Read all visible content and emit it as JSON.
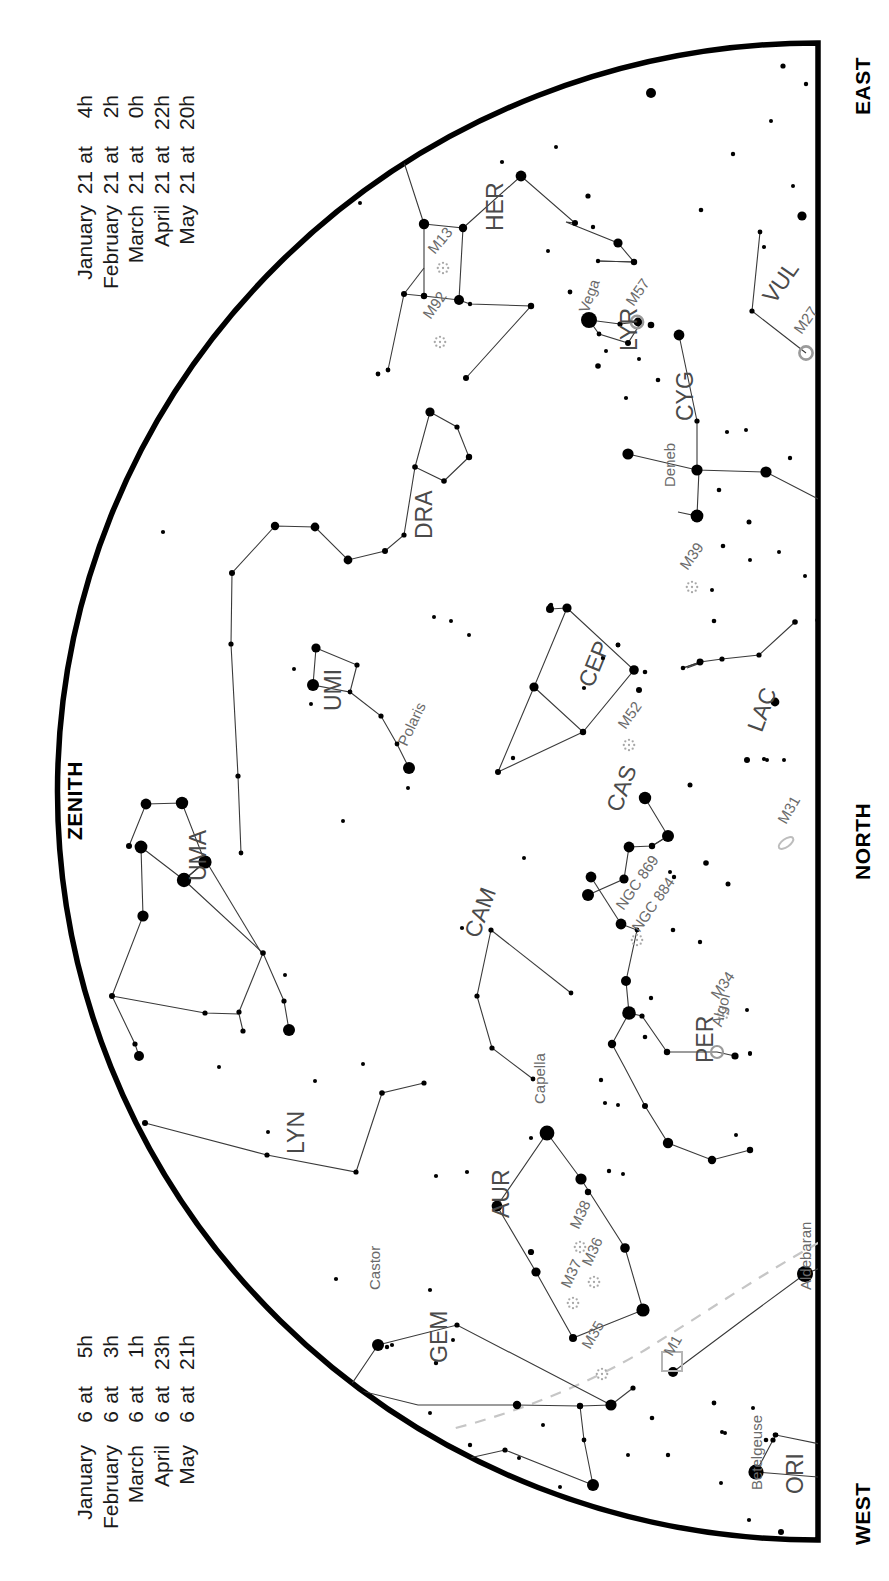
{
  "page": {
    "background_color": "#ffffff",
    "ink_color": "#000000",
    "label_color": "#3a3a3a",
    "ecliptic_color": "#b9b9b9",
    "width": 889,
    "height": 1581
  },
  "cardinals": [
    {
      "name": "east-label",
      "label": "EAST"
    },
    {
      "name": "north-label",
      "label": "NORTH"
    },
    {
      "name": "west-label",
      "label": "WEST"
    },
    {
      "name": "zenith-label",
      "label": "ZENITH"
    }
  ],
  "legend_top": {
    "name": "epoch-legend-upper",
    "rows": [
      {
        "month": "January",
        "day": "21",
        "at": "at",
        "time": "4h"
      },
      {
        "month": "February",
        "day": "21",
        "at": "at",
        "time": "2h"
      },
      {
        "month": "March",
        "day": "21",
        "at": "at",
        "time": "0h"
      },
      {
        "month": "April",
        "day": "21",
        "at": "at",
        "time": "22h"
      },
      {
        "month": "May",
        "day": "21",
        "at": "at",
        "time": "20h"
      }
    ],
    "lines": [
      "January 21 at  4h",
      "February 21 at  2h",
      "March 21 at  0h",
      "April 21 at 22h",
      "May 21 at 20h"
    ]
  },
  "legend_bottom": {
    "name": "epoch-legend-lower",
    "rows": [
      {
        "month": "January",
        "day": "6",
        "at": "at",
        "time": "5h"
      },
      {
        "month": "February",
        "day": "6",
        "at": "at",
        "time": "3h"
      },
      {
        "month": "March",
        "day": "6",
        "at": "at",
        "time": "1h"
      },
      {
        "month": "April",
        "day": "6",
        "at": "at",
        "time": "23h"
      },
      {
        "month": "May",
        "day": "6",
        "at": "at",
        "time": "21h"
      }
    ],
    "lines": [
      "January 6 at  5h",
      "February 6 at  3h",
      "March 6 at  1h",
      "April 6 at 23h",
      "May 6 at 21h"
    ]
  },
  "chart_data": {
    "type": "scatter",
    "projection": "half-disk horizon map (arc = horizon, flat edge right)",
    "legend_position": "left margin, rotated",
    "grid": false,
    "constellations": [
      {
        "abbr": "HER",
        "x": 482,
        "y": 231,
        "rot": -90
      },
      {
        "abbr": "LYR",
        "x": 616,
        "y": 351,
        "rot": -90
      },
      {
        "abbr": "CYG",
        "x": 672,
        "y": 421,
        "rot": -90
      },
      {
        "abbr": "VUL",
        "x": 757,
        "y": 293,
        "rot": -55
      },
      {
        "abbr": "DRA",
        "x": 411,
        "y": 539,
        "rot": -90
      },
      {
        "abbr": "UMI",
        "x": 320,
        "y": 711,
        "rot": -90
      },
      {
        "abbr": "CEP",
        "x": 573,
        "y": 681,
        "rot": -68
      },
      {
        "abbr": "LAC",
        "x": 742,
        "y": 726,
        "rot": -70
      },
      {
        "abbr": "CAS",
        "x": 601,
        "y": 806,
        "rot": -70
      },
      {
        "abbr": "UMA",
        "x": 185,
        "y": 881,
        "rot": -90
      },
      {
        "abbr": "CAM",
        "x": 459,
        "y": 932,
        "rot": -70
      },
      {
        "abbr": "PER",
        "x": 692,
        "y": 1063,
        "rot": -90
      },
      {
        "abbr": "LYN",
        "x": 283,
        "y": 1154,
        "rot": -90
      },
      {
        "abbr": "AUR",
        "x": 488,
        "y": 1218,
        "rot": -90
      },
      {
        "abbr": "GEM",
        "x": 426,
        "y": 1363,
        "rot": -90
      },
      {
        "abbr": "ORI",
        "x": 782,
        "y": 1494,
        "rot": -90
      }
    ],
    "named_stars": [
      {
        "name": "Vega",
        "x": 589,
        "y": 320,
        "mag": 0.0,
        "lx": 575,
        "ly": 309,
        "rot": -70
      },
      {
        "name": "Deneb",
        "x": 677,
        "y": 512,
        "mag": 1.25,
        "lx": 661,
        "ly": 487,
        "rot": -90
      },
      {
        "name": "Polaris",
        "x": 409,
        "y": 768,
        "mag": 2.0,
        "lx": 394,
        "ly": 741,
        "rot": -65
      },
      {
        "name": "Algol",
        "x": 717,
        "y": 1052,
        "mag": 2.1,
        "lx": 708,
        "ly": 1024,
        "rot": -75
      },
      {
        "name": "Capella",
        "x": 547,
        "y": 1133,
        "mag": 0.08,
        "lx": 531,
        "ly": 1104,
        "rot": -90
      },
      {
        "name": "Castor",
        "x": 378,
        "y": 1345,
        "mag": 1.6,
        "lx": 366,
        "ly": 1290,
        "rot": -90
      },
      {
        "name": "Aldebaran",
        "x": 805,
        "y": 1274,
        "mag": 0.85,
        "lx": 797,
        "ly": 1290,
        "rot": -90
      },
      {
        "name": "Betelgeuse",
        "x": 756,
        "y": 1472,
        "mag": 0.5,
        "lx": 748,
        "ly": 1490,
        "rot": -90
      }
    ],
    "deep_sky_objects": [
      {
        "name": "M13",
        "x": 443,
        "y": 268,
        "kind": "cluster",
        "lx": 424,
        "ly": 246,
        "rot": -50
      },
      {
        "name": "M92",
        "x": 440,
        "y": 342,
        "kind": "cluster",
        "lx": 419,
        "ly": 312,
        "rot": -55
      },
      {
        "name": "M57",
        "x": 637,
        "y": 322,
        "kind": "nebula",
        "lx": 622,
        "ly": 299,
        "rot": -55
      },
      {
        "name": "M27",
        "x": 806,
        "y": 353,
        "kind": "nebula",
        "lx": 790,
        "ly": 327,
        "rot": -55
      },
      {
        "name": "M39",
        "x": 692,
        "y": 587,
        "kind": "cluster",
        "lx": 676,
        "ly": 563,
        "rot": -55
      },
      {
        "name": "M52",
        "x": 629,
        "y": 745,
        "kind": "cluster",
        "lx": 614,
        "ly": 722,
        "rot": -55
      },
      {
        "name": "M31",
        "x": 786,
        "y": 843,
        "kind": "galaxy",
        "lx": 774,
        "ly": 818,
        "rot": -60
      },
      {
        "name": "M34",
        "x": 723,
        "y": 1014,
        "kind": "cluster",
        "lx": 707,
        "ly": 992,
        "rot": -55
      },
      {
        "name": "NGC 884",
        "x": 645,
        "y": 947,
        "kind": "cluster",
        "lx": 628,
        "ly": 925,
        "rot": -55
      },
      {
        "name": "NGC 869",
        "x": 625,
        "y": 926,
        "kind": "cluster",
        "lx": 612,
        "ly": 903,
        "rot": -55
      },
      {
        "name": "M38",
        "x": 580,
        "y": 1247,
        "kind": "cluster",
        "lx": 566,
        "ly": 1224,
        "rot": -65
      },
      {
        "name": "M36",
        "x": 594,
        "y": 1282,
        "kind": "cluster",
        "lx": 578,
        "ly": 1261,
        "rot": -65
      },
      {
        "name": "M37",
        "x": 573,
        "y": 1303,
        "kind": "cluster",
        "lx": 557,
        "ly": 1283,
        "rot": -65
      },
      {
        "name": "M35",
        "x": 595,
        "y": 1366,
        "kind": "cluster",
        "lx": 578,
        "ly": 1343,
        "rot": -60
      },
      {
        "name": "M1",
        "x": 673,
        "y": 1372,
        "kind": "nebula",
        "lx": 660,
        "ly": 1350,
        "rot": -60
      }
    ],
    "ecliptic": {
      "label": "ecliptic",
      "style": "dashed",
      "color": "#c2c2c2",
      "path": "M 818 1246 C 760 1272, 690 1318, 628 1356 C 570 1390, 500 1418, 430 1434"
    },
    "horizon": {
      "label": "horizon arc",
      "flat_edge_x": 818,
      "arc_top_y": 43,
      "arc_bottom_y": 1540,
      "arc_left_x": 36
    }
  }
}
